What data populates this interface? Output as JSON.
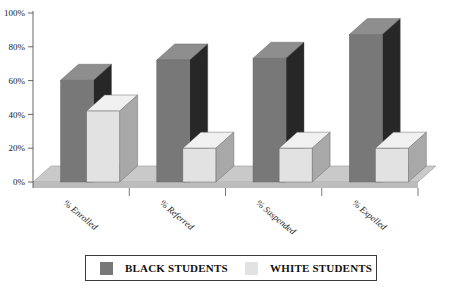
{
  "chart_data": {
    "type": "bar",
    "title": "",
    "xlabel": "",
    "ylabel": "",
    "grid": false,
    "legend_position": "bottom",
    "ylim": [
      0,
      100
    ],
    "ytick_labels": [
      "0%",
      "20%",
      "40%",
      "60%",
      "80%",
      "100%"
    ],
    "ytick_values": [
      0,
      20,
      40,
      60,
      80,
      100
    ],
    "categories": [
      "% Enrolled",
      "% Referred",
      "% Suspended",
      "% Expelled"
    ],
    "series": [
      {
        "name": "BLACK STUDENTS",
        "color": "#787878",
        "values": [
          55,
          67,
          68,
          82
        ]
      },
      {
        "name": "WHITE STUDENTS",
        "color": "#e2e2e2",
        "values": [
          42,
          20,
          20,
          20
        ]
      }
    ]
  },
  "legend": {
    "entries": [
      {
        "label": "BLACK STUDENTS",
        "swatch": "black"
      },
      {
        "label": "WHITE STUDENTS",
        "swatch": "white"
      }
    ]
  },
  "colors": {
    "bar_black_front": "#787878",
    "bar_black_top": "#8e8e8e",
    "bar_black_side": "#272727",
    "bar_white_front": "#e2e2e2",
    "bar_white_top": "#f0f0f0",
    "bar_white_side": "#a8a8a8",
    "floor": "#bdbdbd",
    "floor_top": "#c9c9c9",
    "axis": "#555555"
  }
}
